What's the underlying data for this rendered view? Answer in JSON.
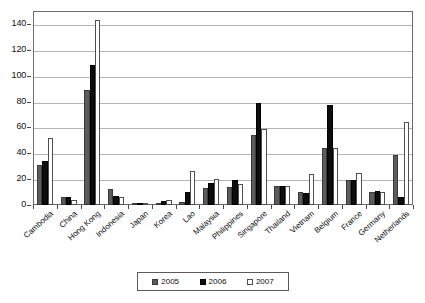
{
  "chart_data": {
    "type": "bar",
    "title": "",
    "subtitle": "",
    "xlabel": "",
    "ylabel": "",
    "ylim": [
      0,
      150
    ],
    "ytick_labels": [
      "0",
      "20",
      "40",
      "60",
      "80",
      "100",
      "120",
      "140"
    ],
    "ytick_values": [
      0,
      20,
      40,
      60,
      80,
      100,
      120,
      140
    ],
    "grid": true,
    "legend_position": "bottom-center",
    "categories": [
      "Cambodia",
      "China",
      "Hong Kong",
      "Indonesia",
      "Japan",
      "Korea",
      "Lao",
      "Malaysia",
      "Philippines",
      "Singapore",
      "Thailand",
      "Vietnam",
      "Belgium",
      "France",
      "Germany",
      "Netherlands"
    ],
    "series": [
      {
        "name": "2005",
        "color": "#5c5c5c",
        "values": [
          31,
          6,
          89,
          12,
          1,
          1,
          2,
          13,
          14,
          54,
          15,
          10,
          44,
          19,
          10,
          39
        ]
      },
      {
        "name": "2006",
        "color": "#0d0d0d",
        "values": [
          34,
          6,
          108,
          7,
          1,
          3,
          10,
          17,
          19,
          79,
          15,
          9,
          77,
          19,
          11,
          6
        ]
      },
      {
        "name": "2007",
        "color": "#ffffff",
        "values": [
          52,
          4,
          143,
          6,
          1,
          4,
          26,
          20,
          16,
          59,
          15,
          24,
          44,
          25,
          10,
          64
        ]
      }
    ]
  },
  "legend": {
    "items": [
      {
        "label": "2005"
      },
      {
        "label": "2006"
      },
      {
        "label": "2007"
      }
    ]
  }
}
